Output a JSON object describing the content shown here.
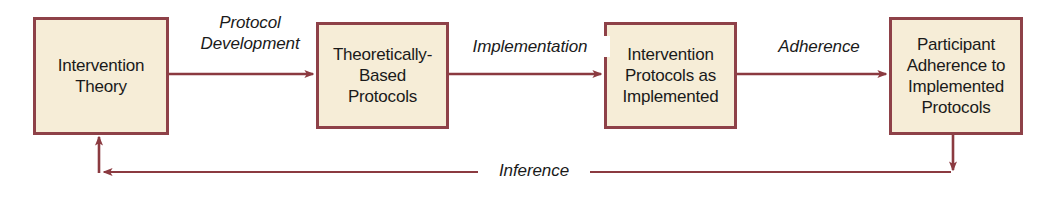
{
  "diagram": {
    "colors": {
      "box_fill": "#f6edd7",
      "box_border": "#8e4148",
      "arrow": "#8b3a40",
      "text": "#1a1a1a",
      "background": "#ffffff"
    },
    "nodes": [
      {
        "id": "intervention-theory",
        "label": "Intervention\nTheory"
      },
      {
        "id": "theoretical-protocols",
        "label": "Theoretically-\nBased\nProtocols"
      },
      {
        "id": "protocols-implemented",
        "label": "Intervention\nProtocols as\nImplemented"
      },
      {
        "id": "participant-adherence",
        "label": "Participant\nAdherence to\nImplemented\nProtocols"
      }
    ],
    "edges": [
      {
        "id": "protocol-development",
        "label": "Protocol\nDevelopment",
        "from": "intervention-theory",
        "to": "theoretical-protocols",
        "direction": "right"
      },
      {
        "id": "implementation",
        "label": "Implementation",
        "from": "theoretical-protocols",
        "to": "protocols-implemented",
        "direction": "right"
      },
      {
        "id": "adherence",
        "label": "Adherence",
        "from": "protocols-implemented",
        "to": "participant-adherence",
        "direction": "right"
      },
      {
        "id": "inference",
        "label": "Inference",
        "from": "participant-adherence",
        "to": "intervention-theory",
        "direction": "feedback-left"
      }
    ]
  }
}
